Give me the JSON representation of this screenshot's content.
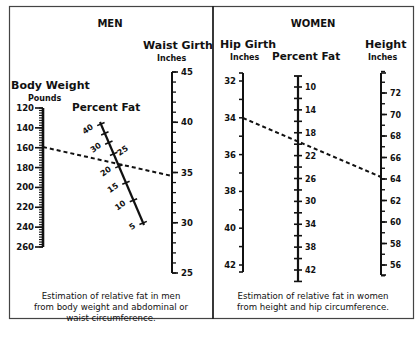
{
  "men": {
    "title": "MEN",
    "body_weight": {
      "label": "Body Weight",
      "unit": "Pounds",
      "ticks": [
        "120",
        "140",
        "160",
        "180",
        "200",
        "220",
        "240",
        "260"
      ]
    },
    "percent_fat": {
      "label": "Percent Fat",
      "ticks": [
        "40",
        "30",
        "25",
        "20",
        "15",
        "10",
        "5"
      ]
    },
    "waist_girth": {
      "label": "Waist Girth",
      "unit": "Inches",
      "ticks": [
        "45",
        "40",
        "35",
        "30",
        "25"
      ]
    },
    "caption": [
      "Estimation of relative fat in men",
      "from body weight and abdominal or",
      "waist circumference."
    ]
  },
  "women": {
    "title": "WOMEN",
    "hip_girth": {
      "label": "Hip Girth",
      "unit": "Inches",
      "ticks": [
        "32",
        "34",
        "36",
        "38",
        "40",
        "42"
      ]
    },
    "percent_fat": {
      "label": "Percent Fat",
      "ticks": [
        "10",
        "14",
        "18",
        "22",
        "26",
        "30",
        "34",
        "38",
        "42"
      ]
    },
    "height": {
      "label": "Height",
      "unit": "Inches",
      "ticks": [
        "72",
        "70",
        "68",
        "66",
        "64",
        "62",
        "60",
        "58",
        "56"
      ]
    },
    "caption": [
      "Estimation of relative fat in women",
      "from height and hip circumference."
    ]
  },
  "colors": {
    "ink": "#111111",
    "frame": "#333333",
    "background": "#ffffff"
  },
  "chart_data": [
    {
      "type": "nomogram",
      "title": "MEN",
      "scales": [
        {
          "name": "Body Weight",
          "unit": "Pounds",
          "min": 120,
          "max": 260,
          "major_step": 20,
          "minor_step": 2.5
        },
        {
          "name": "Percent Fat",
          "unit": "%",
          "values": [
            40,
            30,
            25,
            20,
            15,
            10,
            5
          ],
          "orientation": "diagonal"
        },
        {
          "name": "Waist Girth",
          "unit": "Inches",
          "min": 25,
          "max": 45,
          "major_step": 5,
          "minor_step": 1
        }
      ],
      "example_line": {
        "body_weight": 160,
        "waist_girth": 35,
        "percent_fat": 20
      },
      "caption": "Estimation of relative fat in men from body weight and abdominal or waist circumference."
    },
    {
      "type": "nomogram",
      "title": "WOMEN",
      "scales": [
        {
          "name": "Hip Girth",
          "unit": "Inches",
          "min": 32,
          "max": 42,
          "major_step": 2,
          "minor_step": 1
        },
        {
          "name": "Percent Fat",
          "unit": "%",
          "min": 10,
          "max": 42,
          "major_step": 4,
          "minor_step": 2
        },
        {
          "name": "Height",
          "unit": "Inches",
          "min": 56,
          "max": 72,
          "major_step": 2,
          "minor_step": 1
        }
      ],
      "example_line": {
        "hip_girth": 34,
        "height": 64,
        "percent_fat": 20.5
      },
      "caption": "Estimation of relative fat in women from height and hip circumference."
    }
  ]
}
